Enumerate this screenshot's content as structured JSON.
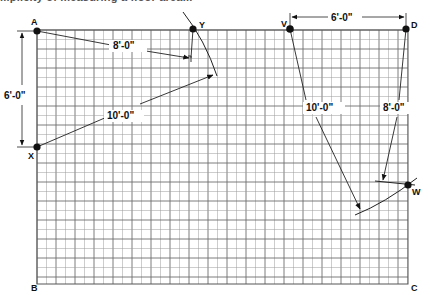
{
  "caption_fragment": "...plicity of measuring a floor area...",
  "grid": {
    "x0": 37,
    "y0": 30,
    "x1": 408,
    "y1": 284,
    "cell": 9.5,
    "major_every": 2,
    "minor_color": "#9a9a9a",
    "major_color": "#6e6e6e"
  },
  "points": [
    {
      "id": "A",
      "label": "A",
      "x": 37,
      "y": 31,
      "dot": true,
      "lx": 31,
      "ly": 25
    },
    {
      "id": "Y",
      "label": "Y",
      "x": 193,
      "y": 29,
      "dot": true,
      "lx": 199,
      "ly": 27
    },
    {
      "id": "X",
      "label": "X",
      "x": 37,
      "y": 147,
      "dot": true,
      "lx": 28,
      "ly": 159
    },
    {
      "id": "V",
      "label": "V",
      "x": 290,
      "y": 29,
      "dot": true,
      "lx": 281,
      "ly": 27
    },
    {
      "id": "D",
      "label": "D",
      "x": 406,
      "y": 29,
      "dot": true,
      "lx": 411,
      "ly": 27
    },
    {
      "id": "W",
      "label": "W",
      "x": 408,
      "y": 185,
      "dot": true,
      "lx": 412,
      "ly": 194
    },
    {
      "id": "B",
      "label": "B",
      "x": 37,
      "y": 284,
      "dot": false,
      "lx": 31,
      "ly": 290
    },
    {
      "id": "C",
      "label": "C",
      "x": 408,
      "y": 284,
      "dot": false,
      "lx": 411,
      "ly": 290
    }
  ],
  "dimensions": [
    {
      "id": "dim-A-X",
      "label": "6'-0\"",
      "from": "A",
      "to": "X",
      "type": "vertical-extension",
      "label_x": 4,
      "label_y": 97
    },
    {
      "id": "dim-V-D",
      "label": "6'-0\"",
      "from": "V",
      "to": "D",
      "type": "horizontal-extension",
      "label_x": 331,
      "label_y": 21
    },
    {
      "id": "dim-A-Y",
      "label": "8'-0\"",
      "from": "A",
      "to": "Y",
      "type": "measure",
      "label_x": 113,
      "label_y": 49
    },
    {
      "id": "dim-X-Y",
      "label": "10'-0\"",
      "from": "X",
      "to": "Y",
      "type": "measure",
      "label_x": 107,
      "label_y": 119
    },
    {
      "id": "dim-V-W",
      "label": "10'-0\"",
      "from": "V",
      "to": "W",
      "type": "measure",
      "label_x": 306,
      "label_y": 111
    },
    {
      "id": "dim-D-W",
      "label": "8'-0\"",
      "from": "D",
      "to": "W",
      "type": "measure",
      "label_x": 383,
      "label_y": 111
    }
  ],
  "labels": {
    "A": "A",
    "Y": "Y",
    "X": "X",
    "V": "V",
    "D": "D",
    "W": "W",
    "B": "B",
    "C": "C",
    "dim_AX": "6'-0\"",
    "dim_VD": "6'-0\"",
    "dim_AY": "8'-0\"",
    "dim_XY": "10'-0\"",
    "dim_VW": "10'-0\"",
    "dim_DW": "8'-0\""
  }
}
